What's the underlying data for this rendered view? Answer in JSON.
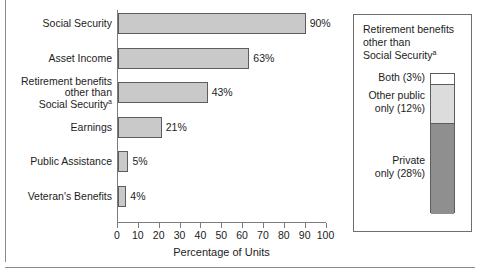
{
  "chart_data": {
    "type": "bar",
    "orientation": "horizontal",
    "title": "",
    "xlabel": "Percentage of Units",
    "ylabel": "",
    "xlim": [
      0,
      100
    ],
    "xticks": [
      0,
      10,
      20,
      30,
      40,
      50,
      60,
      70,
      80,
      90,
      100
    ],
    "grid": false,
    "legend": "none",
    "categories": [
      "Social Security",
      "Asset Income",
      "Retirement benefits other than Social Securityᵃ",
      "Earnings",
      "Public Assistance",
      "Veteran's Benefits"
    ],
    "values": [
      90,
      63,
      43,
      21,
      5,
      4
    ],
    "value_labels": [
      "90%",
      "63%",
      "43%",
      "21%",
      "5%",
      "4%"
    ],
    "bar_color": "#c9c9c9",
    "bar_edge_color": "#5d5d5d",
    "secondary_chart": {
      "type": "bar",
      "stacked": true,
      "title": "Retirement benefits other than Social Securityᵃ",
      "categories": [
        "Both",
        "Other public only",
        "Private only"
      ],
      "values": [
        3,
        12,
        28
      ],
      "labels": [
        "Both (3%)",
        "Other public only (12%)",
        "Private only (28%)"
      ],
      "colors": [
        "#ffffff",
        "#dcdcdc",
        "#8f8f8f"
      ]
    }
  },
  "barchart": {
    "axis": {
      "x_title": "Percentage of Units",
      "ticks": [
        "0",
        "10",
        "20",
        "30",
        "40",
        "50",
        "60",
        "70",
        "80",
        "90",
        "100"
      ]
    },
    "bars": [
      {
        "label_lines": [
          "Social Security"
        ],
        "value": 90,
        "value_label": "90%"
      },
      {
        "label_lines": [
          "Asset Income"
        ],
        "value": 63,
        "value_label": "63%"
      },
      {
        "label_lines": [
          "Retirement benefits",
          "other than",
          "Social Security"
        ],
        "superscript": "a",
        "value": 43,
        "value_label": "43%"
      },
      {
        "label_lines": [
          "Earnings"
        ],
        "value": 21,
        "value_label": "21%"
      },
      {
        "label_lines": [
          "Public Assistance"
        ],
        "value": 5,
        "value_label": "5%"
      },
      {
        "label_lines": [
          "Veteran's Benefits"
        ],
        "value": 4,
        "value_label": "4%"
      }
    ]
  },
  "panel": {
    "title_lines": [
      "Retirement benefits",
      "other than",
      "Social Security"
    ],
    "title_superscript": "a",
    "segments": [
      {
        "label": "Both (3%)",
        "value": 3,
        "color": "#ffffff"
      },
      {
        "label_lines": [
          "Other public",
          "only (12%)"
        ],
        "value": 12,
        "color": "#dcdcdc"
      },
      {
        "label_lines": [
          "Private",
          "only (28%)"
        ],
        "value": 28,
        "color": "#8f8f8f"
      }
    ]
  },
  "colors": {
    "bar_fill": "#c9c9c9",
    "bar_stroke": "#5d5d5d",
    "axis": "#7c7c7c",
    "text": "#1c1c1c",
    "panel_border": "#6e6e6e"
  }
}
